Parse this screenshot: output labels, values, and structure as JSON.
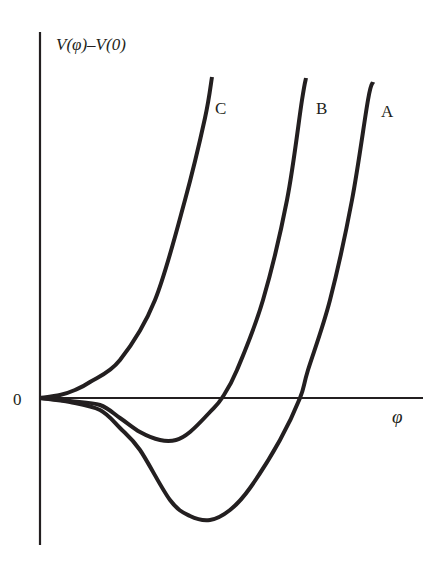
{
  "chart_data": {
    "type": "line",
    "title": "",
    "xlabel": "φ",
    "ylabel": "V(φ)–V(0)",
    "origin_label": "0",
    "xlim": [
      0,
      3.85
    ],
    "ylim": [
      -1.45,
      3.65
    ],
    "grid": false,
    "legend": "inline labels at top of each curve",
    "colors": {
      "curve": "#231f20",
      "axis": "#231f20",
      "background": "#ffffff"
    },
    "series": [
      {
        "name": "A",
        "points": [
          [
            0,
            0
          ],
          [
            0.3,
            -0.04
          ],
          [
            0.6,
            -0.12
          ],
          [
            0.8,
            -0.3
          ],
          [
            1.0,
            -0.52
          ],
          [
            1.3,
            -1.02
          ],
          [
            1.5,
            -1.18
          ],
          [
            1.7,
            -1.22
          ],
          [
            1.9,
            -1.12
          ],
          [
            2.1,
            -0.9
          ],
          [
            2.4,
            -0.42
          ],
          [
            2.6,
            0.0
          ],
          [
            2.68,
            0.28
          ],
          [
            2.9,
            0.98
          ],
          [
            3.12,
            1.98
          ],
          [
            3.28,
            2.98
          ],
          [
            3.33,
            3.16
          ]
        ]
      },
      {
        "name": "B",
        "points": [
          [
            0,
            0
          ],
          [
            0.3,
            -0.03
          ],
          [
            0.6,
            -0.07
          ],
          [
            0.8,
            -0.2
          ],
          [
            1.0,
            -0.34
          ],
          [
            1.2,
            -0.42
          ],
          [
            1.36,
            -0.42
          ],
          [
            1.5,
            -0.34
          ],
          [
            1.7,
            -0.14
          ],
          [
            1.82,
            0.0
          ],
          [
            1.97,
            0.28
          ],
          [
            2.23,
            0.98
          ],
          [
            2.47,
            1.98
          ],
          [
            2.62,
            2.98
          ],
          [
            2.66,
            3.2
          ]
        ]
      },
      {
        "name": "C",
        "points": [
          [
            0,
            0
          ],
          [
            0.2,
            0.03
          ],
          [
            0.35,
            0.08
          ],
          [
            0.5,
            0.16
          ],
          [
            0.8,
            0.38
          ],
          [
            1.15,
            0.98
          ],
          [
            1.45,
            1.98
          ],
          [
            1.65,
            2.8
          ],
          [
            1.72,
            3.21
          ]
        ]
      }
    ]
  }
}
